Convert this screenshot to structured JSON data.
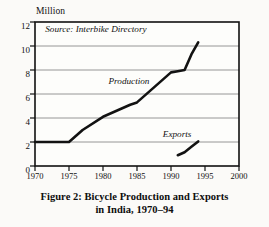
{
  "chart_data": {
    "type": "line",
    "title": "",
    "xlabel": "",
    "ylabel": "Million",
    "xlim": [
      1970,
      2000
    ],
    "ylim": [
      0,
      12
    ],
    "grid": true,
    "legend_position": "inline-annotation",
    "xticks": [
      1970,
      1975,
      1980,
      1985,
      1990,
      1995,
      2000
    ],
    "yticks": [
      0,
      2,
      4,
      6,
      8,
      10,
      12
    ],
    "annotations": [
      {
        "text": "Source: Interbike Directory",
        "x": 1971.5,
        "y": 11.2,
        "style": "italic"
      },
      {
        "text": "Production",
        "x": 1980.8,
        "y": 6.85,
        "style": "italic"
      },
      {
        "text": "Exports",
        "x": 1988.8,
        "y": 2.45,
        "style": "italic"
      }
    ],
    "series": [
      {
        "name": "Production",
        "x": [
          1970,
          1975,
          1977,
          1980,
          1982,
          1984,
          1985,
          1987,
          1989,
          1990,
          1991,
          1992,
          1993,
          1994
        ],
        "values": [
          2.0,
          2.0,
          3.0,
          4.1,
          4.6,
          5.1,
          5.3,
          6.3,
          7.3,
          7.8,
          7.9,
          8.0,
          9.3,
          10.3
        ]
      },
      {
        "name": "Exports",
        "x": [
          1991,
          1992,
          1993,
          1994
        ],
        "values": [
          0.9,
          1.15,
          1.6,
          2.05
        ]
      }
    ]
  },
  "chart": {
    "y_axis_title": "Million",
    "source_note": "Source: Interbike Directory",
    "production_label": "Production",
    "exports_label": "Exports",
    "ytick_labels": [
      "12",
      "10",
      "8",
      "6",
      "4",
      "2",
      "0"
    ],
    "xtick_labels": [
      "1970",
      "1975",
      "1980",
      "1985",
      "1990",
      "1995",
      "2000"
    ]
  },
  "caption": {
    "line1": "Figure 2: Bicycle Production and Exports",
    "line2": "in India, 1970–94"
  },
  "colors": {
    "ink": "#111111",
    "grid": "#7a7a7a",
    "axis": "#111111",
    "paper": "#fbfaf8"
  }
}
